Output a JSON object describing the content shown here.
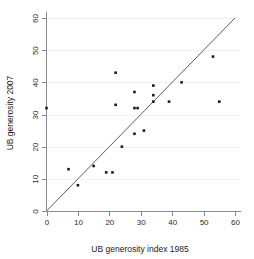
{
  "chart_data": {
    "type": "scatter",
    "title": "",
    "xlabel": "UB generosity index 1985",
    "ylabel": "UB generosity 2007",
    "xlim": [
      0,
      62
    ],
    "ylim": [
      0,
      62
    ],
    "xticks": [
      0,
      10,
      20,
      30,
      40,
      50,
      60
    ],
    "yticks": [
      0,
      10,
      20,
      30,
      40,
      50,
      60
    ],
    "xtick_labels": [
      "0",
      "10",
      "20",
      "30",
      "40",
      "50",
      "60"
    ],
    "ytick_labels": [
      "0",
      "10",
      "20",
      "30",
      "40",
      "50",
      "60"
    ],
    "grid": "horizontal-faint",
    "legend": "none",
    "marker_color": "#1a1a1a",
    "marker_shape": "square",
    "reference_line": {
      "name": "45-degree line",
      "type": "identity",
      "from": [
        0,
        0
      ],
      "to": [
        60,
        60
      ],
      "color": "#4a4a4a"
    },
    "points": [
      {
        "x": 0,
        "y": 32
      },
      {
        "x": 7,
        "y": 13
      },
      {
        "x": 10,
        "y": 8
      },
      {
        "x": 15,
        "y": 14
      },
      {
        "x": 19,
        "y": 12
      },
      {
        "x": 21,
        "y": 12
      },
      {
        "x": 22,
        "y": 43
      },
      {
        "x": 22,
        "y": 33
      },
      {
        "x": 24,
        "y": 20
      },
      {
        "x": 28,
        "y": 37
      },
      {
        "x": 28,
        "y": 32
      },
      {
        "x": 29,
        "y": 32
      },
      {
        "x": 28,
        "y": 24
      },
      {
        "x": 31,
        "y": 25
      },
      {
        "x": 34,
        "y": 39
      },
      {
        "x": 34,
        "y": 36
      },
      {
        "x": 34,
        "y": 34
      },
      {
        "x": 39,
        "y": 34
      },
      {
        "x": 43,
        "y": 40
      },
      {
        "x": 53,
        "y": 48
      },
      {
        "x": 55,
        "y": 34
      }
    ]
  },
  "figure": {
    "background_color": "#ffffff",
    "axis_color": "#8a8a8a"
  }
}
